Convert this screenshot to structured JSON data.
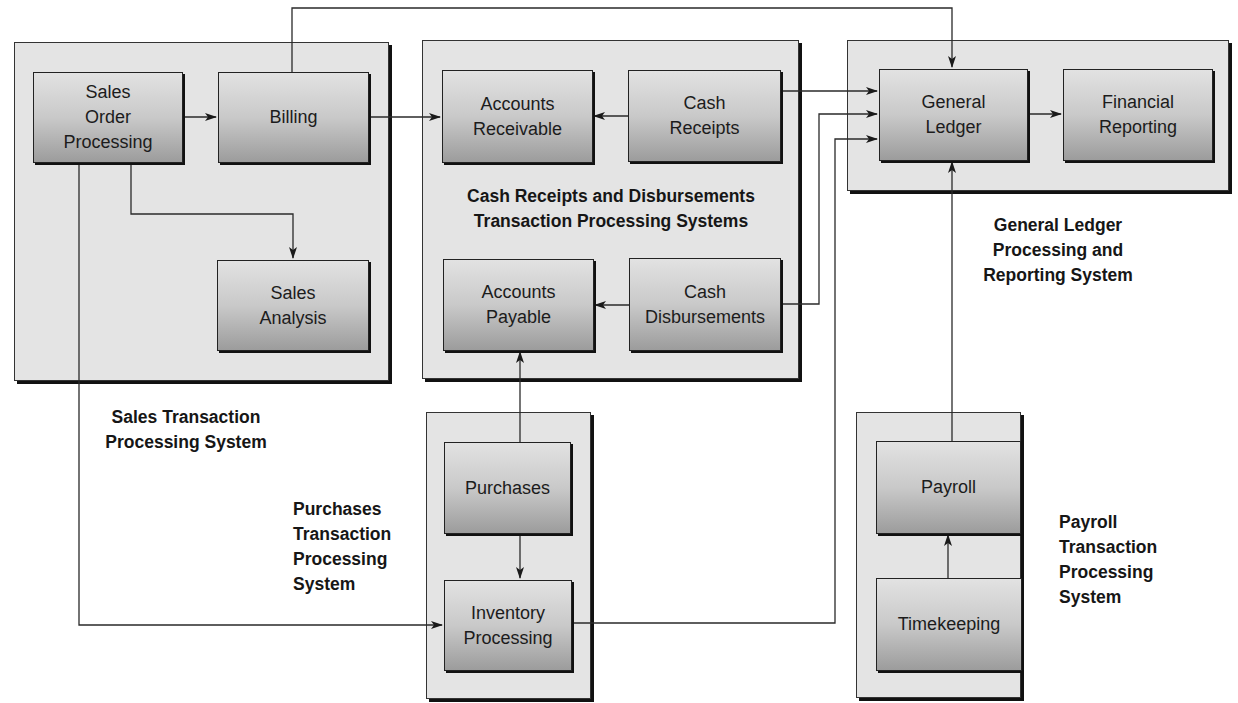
{
  "diagram": {
    "systems": {
      "sales": {
        "label": "Sales Transaction\nProcessing System",
        "boxes": {
          "sales_order": "Sales\nOrder\nProcessing",
          "billing": "Billing",
          "sales_analysis": "Sales\nAnalysis"
        }
      },
      "cash": {
        "label": "Cash Receipts and Disbursements\nTransaction Processing Systems",
        "boxes": {
          "accounts_receivable": "Accounts\nReceivable",
          "cash_receipts": "Cash\nReceipts",
          "accounts_payable": "Accounts\nPayable",
          "cash_disbursements": "Cash\nDisbursements"
        }
      },
      "general_ledger": {
        "label": "General Ledger\nProcessing and\nReporting System",
        "boxes": {
          "general_ledger": "General\nLedger",
          "financial_reporting": "Financial\nReporting"
        }
      },
      "purchases": {
        "label": "Purchases\nTransaction\nProcessing\nSystem",
        "boxes": {
          "purchases": "Purchases",
          "inventory": "Inventory\nProcessing"
        }
      },
      "payroll": {
        "label": "Payroll\nTransaction\nProcessing\nSystem",
        "boxes": {
          "payroll": "Payroll",
          "timekeeping": "Timekeeping"
        }
      }
    },
    "flows": [
      {
        "from": "Sales Order Processing",
        "to": "Billing"
      },
      {
        "from": "Sales Order Processing",
        "to": "Sales Analysis"
      },
      {
        "from": "Sales Order Processing",
        "to": "Inventory Processing"
      },
      {
        "from": "Billing",
        "to": "Accounts Receivable"
      },
      {
        "from": "Billing",
        "to": "General Ledger"
      },
      {
        "from": "Cash Receipts",
        "to": "Accounts Receivable"
      },
      {
        "from": "Cash Receipts",
        "to": "General Ledger"
      },
      {
        "from": "Cash Disbursements",
        "to": "Accounts Payable"
      },
      {
        "from": "Cash Disbursements",
        "to": "General Ledger"
      },
      {
        "from": "Purchases",
        "to": "Accounts Payable"
      },
      {
        "from": "Purchases",
        "to": "Inventory Processing"
      },
      {
        "from": "Inventory Processing",
        "to": "General Ledger"
      },
      {
        "from": "Timekeeping",
        "to": "Payroll"
      },
      {
        "from": "Payroll",
        "to": "General Ledger"
      },
      {
        "from": "General Ledger",
        "to": "Financial Reporting"
      }
    ]
  }
}
